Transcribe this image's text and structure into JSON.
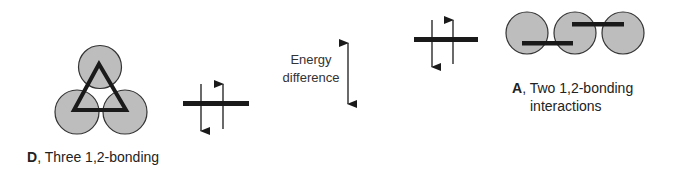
{
  "diagram": {
    "colors": {
      "lobe_fill": "#bdbdbd",
      "lobe_stroke": "#333333",
      "bond": "#1a1a1a",
      "text": "#222222"
    }
  },
  "structure_D": {
    "letter": "D",
    "caption": ", Three 1,2-bonding",
    "lobes": 3,
    "arrangement": "triangle",
    "bond_shape": "triangle-icon"
  },
  "structure_A": {
    "letter": "A",
    "caption_line1": ", Two 1,2-bonding",
    "caption_line2": "interactions",
    "lobes": 3,
    "arrangement": "linear",
    "bond_shape": "two-offset-bars"
  },
  "energy_levels": {
    "D": {
      "electrons": [
        "down",
        "up"
      ],
      "relative_position": "lower"
    },
    "A": {
      "electrons": [
        "down",
        "up"
      ],
      "relative_position": "higher"
    }
  },
  "energy_label": {
    "line1": "Energy",
    "line2": "difference",
    "arrow": "double-headed-vertical-arrow-icon"
  }
}
